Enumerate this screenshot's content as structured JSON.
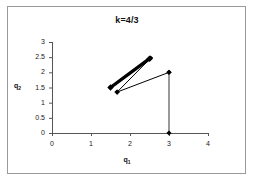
{
  "chart_data": {
    "type": "line",
    "title": "k=4/3",
    "xlabel": "q₁",
    "ylabel": "q₂",
    "xlabel_base": "q",
    "xlabel_sub": "1",
    "ylabel_base": "q",
    "ylabel_sub": "2",
    "xlim": [
      0,
      4
    ],
    "ylim": [
      0,
      3
    ],
    "xticks": [
      0,
      1,
      2,
      3,
      4
    ],
    "xtick_labels": [
      "0",
      "1",
      "2",
      "3",
      "4"
    ],
    "yticks": [
      0,
      0.5,
      1,
      1.5,
      2,
      2.5,
      3
    ],
    "ytick_labels": [
      "0",
      "0.5",
      "1",
      "1.5",
      "2",
      "2.5",
      "3"
    ],
    "grid": false,
    "legend": "none",
    "series": [
      {
        "name": "thick-segment",
        "style": "thick-black-diamond",
        "color": "#000000",
        "line_width": 3.4,
        "marker": "diamond",
        "points": [
          {
            "x": 1.5,
            "y": 1.5
          },
          {
            "x": 2.5,
            "y": 2.45
          }
        ]
      },
      {
        "name": "thin-segment-upper",
        "style": "thin-black-diamond",
        "color": "#000000",
        "line_width": 1.0,
        "marker": "diamond",
        "points": [
          {
            "x": 1.67,
            "y": 1.35
          },
          {
            "x": 2.53,
            "y": 2.47
          }
        ]
      },
      {
        "name": "thin-segment-lower",
        "style": "thin-black-diamond",
        "color": "#000000",
        "line_width": 1.0,
        "marker": "diamond",
        "points": [
          {
            "x": 1.67,
            "y": 1.35
          },
          {
            "x": 3.0,
            "y": 2.0
          }
        ]
      },
      {
        "name": "vertical-drop",
        "style": "gray-vertical",
        "color": "#808080",
        "line_width": 1.6,
        "marker": "diamond",
        "points": [
          {
            "x": 3.0,
            "y": 2.0
          },
          {
            "x": 3.0,
            "y": 0.0
          }
        ]
      }
    ]
  },
  "axis": {
    "origin_px": {
      "x": 52,
      "y": 133
    },
    "x_end_px": 208,
    "y_top_px": 42
  }
}
